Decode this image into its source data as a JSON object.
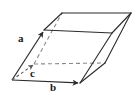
{
  "figure": {
    "kind": "crystal-unit-cell-parallelepiped",
    "background_color": "#ffffff",
    "stroke_color": "#2b2b2b",
    "hidden_stroke_color": "#8a8a8a",
    "label_color": "#1a1a1a",
    "width": 139,
    "height": 100
  },
  "labels": {
    "a": "a",
    "b": "b",
    "c": "c"
  },
  "vectors": [
    {
      "name": "a",
      "label": "a",
      "style": "solid",
      "arrow": true,
      "from": [
        12,
        80
      ],
      "to": [
        44,
        30
      ]
    },
    {
      "name": "b",
      "label": "b",
      "style": "solid",
      "arrow": true,
      "from": [
        12,
        80
      ],
      "to": [
        80,
        83
      ]
    },
    {
      "name": "c",
      "label": "c",
      "style": "dashed",
      "arrow": true,
      "from": [
        12,
        80
      ],
      "to": [
        34,
        64
      ]
    }
  ],
  "vertices": {
    "origin": [
      12,
      80
    ],
    "front_bottom_right": [
      80,
      83
    ],
    "front_top_left": [
      44,
      30
    ],
    "front_top_right": [
      112,
      33
    ],
    "back_bottom_left": [
      34,
      64
    ],
    "back_bottom_right": [
      105,
      63
    ],
    "back_top_left": [
      62,
      13
    ],
    "back_top_right": [
      131,
      13
    ]
  },
  "edges": [
    {
      "name": "bottom-front",
      "style": "solid",
      "from": "origin",
      "to": "front_bottom_right"
    },
    {
      "name": "left-front",
      "style": "solid",
      "from": "origin",
      "to": "front_top_left"
    },
    {
      "name": "top-front",
      "style": "solid",
      "from": "front_top_left",
      "to": "front_top_right"
    },
    {
      "name": "right-front",
      "style": "solid",
      "from": "front_bottom_right",
      "to": "front_top_right"
    },
    {
      "name": "top-left-depth",
      "style": "solid",
      "from": "front_top_left",
      "to": "back_top_left"
    },
    {
      "name": "top-back",
      "style": "solid",
      "from": "back_top_left",
      "to": "back_top_right"
    },
    {
      "name": "top-right-depth",
      "style": "solid",
      "from": "front_top_right",
      "to": "back_top_right"
    },
    {
      "name": "right-back",
      "style": "solid",
      "from": "front_bottom_right",
      "to": "back_bottom_right"
    },
    {
      "name": "back-right-vertical",
      "style": "solid",
      "from": "back_bottom_right",
      "to": "back_top_right"
    },
    {
      "name": "bottom-back-hidden",
      "style": "dashed",
      "from": "back_bottom_left",
      "to": "back_bottom_right"
    },
    {
      "name": "left-back-hidden",
      "style": "dashed",
      "from": "back_bottom_left",
      "to": "back_top_left"
    }
  ]
}
